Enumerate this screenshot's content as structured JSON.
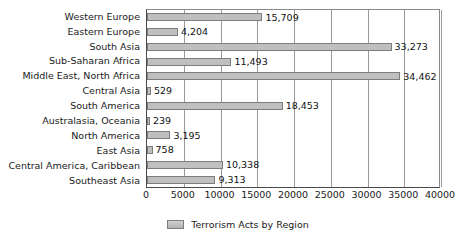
{
  "chart_data": {
    "type": "bar",
    "orientation": "horizontal",
    "title": "",
    "xlabel": "",
    "ylabel": "",
    "categories": [
      "Western Europe",
      "Eastern Europe",
      "South Asia",
      "Sub-Saharan Africa",
      "Middle East, North Africa",
      "Central Asia",
      "South America",
      "Australasia, Oceania",
      "North America",
      "East Asia",
      "Central America, Caribbean",
      "Southeast Asia"
    ],
    "values": [
      15709,
      4204,
      33273,
      11493,
      34462,
      529,
      18453,
      239,
      3195,
      758,
      10338,
      9313
    ],
    "value_labels": [
      "15,709",
      "4,204",
      "33,273",
      "11,493",
      "34,462",
      "529",
      "18,453",
      "239",
      "3,195",
      "758",
      "10,338",
      "9,313"
    ],
    "series": [
      {
        "name": "Terrorism Acts by Region",
        "values": [
          15709,
          4204,
          33273,
          11493,
          34462,
          529,
          18453,
          239,
          3195,
          758,
          10338,
          9313
        ],
        "color": "#bfbfbf"
      }
    ],
    "xlim": [
      0,
      40000
    ],
    "xticks": [
      0,
      5000,
      10000,
      15000,
      20000,
      25000,
      30000,
      35000,
      40000
    ],
    "xtick_labels": [
      "0",
      "5000",
      "10000",
      "15000",
      "20000",
      "25000",
      "30000",
      "35000",
      "40000"
    ],
    "grid": true,
    "grid_axis": "x",
    "legend_position": "bottom",
    "legend_entries": [
      {
        "label": "Terrorism Acts by Region",
        "color": "#bfbfbf"
      }
    ],
    "colors": {
      "bar_fill": "#bfbfbf",
      "bar_border": "#7d7d7d",
      "gridline": "#9a9a9a",
      "axis": "#4a4a4a",
      "text": "#1a1a1a",
      "background": "#ffffff"
    }
  }
}
